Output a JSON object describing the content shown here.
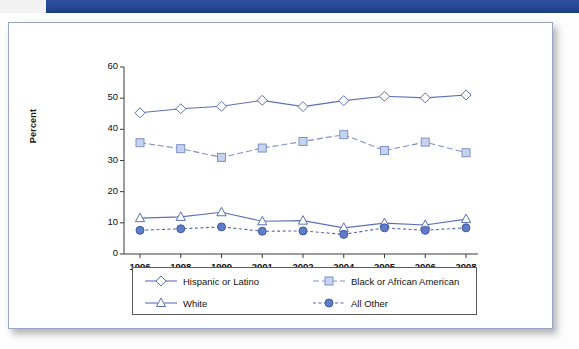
{
  "document": {
    "header_band_color": "#27499a"
  },
  "chart_data": {
    "type": "line",
    "title": "",
    "xlabel": "",
    "ylabel": "Percent",
    "categories": [
      "1996",
      "1998",
      "1999",
      "2001",
      "2002",
      "2004",
      "2005",
      "2006",
      "2008"
    ],
    "ylim": [
      0,
      60
    ],
    "yticks": [
      0,
      10,
      20,
      30,
      40,
      50,
      60
    ],
    "grid": false,
    "legend_position": "bottom",
    "series": [
      {
        "name": "Hispanic or Latino",
        "marker": "open-diamond",
        "line_style": "solid",
        "color": "#5b71b5",
        "values": [
          45.3,
          46.6,
          47.4,
          49.3,
          47.3,
          49.2,
          50.6,
          50.1,
          51.0
        ]
      },
      {
        "name": "Black or African American",
        "marker": "filled-square",
        "line_style": "dashed",
        "color": "#7e92c9",
        "values": [
          35.7,
          33.8,
          31.0,
          34.0,
          36.1,
          38.3,
          33.2,
          35.9,
          32.5
        ]
      },
      {
        "name": "White",
        "marker": "open-triangle",
        "line_style": "solid",
        "color": "#5b71b5",
        "values": [
          11.5,
          11.9,
          13.4,
          10.5,
          10.7,
          8.4,
          9.9,
          9.3,
          11.2
        ]
      },
      {
        "name": "All Other",
        "marker": "filled-circle",
        "line_style": "dotted",
        "color": "#4f68b0",
        "values": [
          7.6,
          8.1,
          8.7,
          7.3,
          7.4,
          6.3,
          8.4,
          7.6,
          8.4
        ]
      }
    ]
  }
}
